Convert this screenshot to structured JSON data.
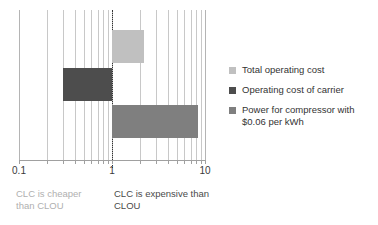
{
  "chart_data": {
    "type": "bar",
    "orientation": "horizontal",
    "title": "",
    "xlabel": "",
    "ylabel": "",
    "xscale": "log",
    "xlim": [
      0.1,
      10
    ],
    "tick_labels": [
      "0.1",
      "1",
      "10"
    ],
    "tick_values": [
      0.1,
      1,
      10
    ],
    "grid": true,
    "reference_line": 1,
    "legend_position": "right",
    "series": [
      {
        "name": "Total operating cost",
        "color": "#c0c0c0",
        "start": 1,
        "value": 2.2
      },
      {
        "name": "Operating cost of carrier",
        "color": "#4d4d4d",
        "start": 0.3,
        "value": 1
      },
      {
        "name": "Power for compressor with $0.06 per kWh",
        "color": "#7f7f7f",
        "start": 1,
        "value": 8.5
      }
    ]
  },
  "legend": {
    "items": [
      {
        "label": "Total operating cost"
      },
      {
        "label": "Operating cost of carrier"
      },
      {
        "label": "Power for compressor with $0.06 per kWh"
      }
    ]
  },
  "axis": {
    "ticks": [
      {
        "label": "0.1"
      },
      {
        "label": "1"
      },
      {
        "label": "10"
      }
    ]
  },
  "captions": {
    "left": "CLC is cheaper\nthan CLOU",
    "right": "CLC is expensive than\nCLOU"
  }
}
